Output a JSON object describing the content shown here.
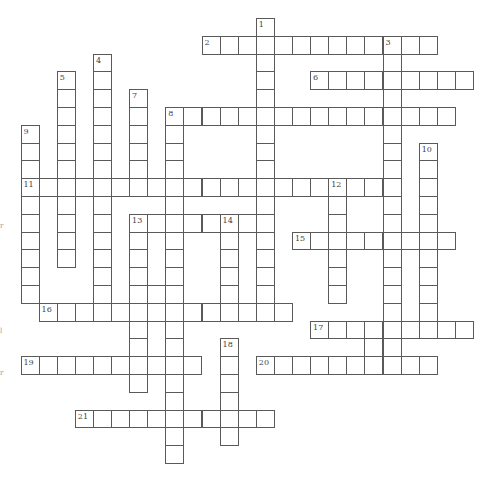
{
  "puzzle": {
    "type": "crossword",
    "grid_unit": "cell",
    "words": [
      {
        "number": 1,
        "direction": "down",
        "row": 0,
        "col": 13,
        "length": 17
      },
      {
        "number": 2,
        "direction": "across",
        "row": 1,
        "col": 10,
        "length": 13
      },
      {
        "number": 3,
        "direction": "down",
        "row": 1,
        "col": 20,
        "length": 19
      },
      {
        "number": 4,
        "direction": "down",
        "row": 2,
        "col": 4,
        "length": 15
      },
      {
        "number": 5,
        "direction": "down",
        "row": 3,
        "col": 2,
        "length": 11
      },
      {
        "number": 6,
        "direction": "across",
        "row": 3,
        "col": 16,
        "length": 9
      },
      {
        "number": 7,
        "direction": "down",
        "row": 4,
        "col": 6,
        "length": 6
      },
      {
        "number": 8,
        "direction": "across",
        "row": 5,
        "col": 8,
        "length": 16
      },
      {
        "number": 8,
        "direction": "down",
        "row": 5,
        "col": 8,
        "length": 20
      },
      {
        "number": 9,
        "direction": "down",
        "row": 6,
        "col": 0,
        "length": 10
      },
      {
        "number": 10,
        "direction": "down",
        "row": 7,
        "col": 22,
        "length": 11
      },
      {
        "number": 11,
        "direction": "across",
        "row": 9,
        "col": 0,
        "length": 21
      },
      {
        "number": 12,
        "direction": "down",
        "row": 9,
        "col": 17,
        "length": 7
      },
      {
        "number": 13,
        "direction": "across",
        "row": 11,
        "col": 6,
        "length": 8
      },
      {
        "number": 13,
        "direction": "down",
        "row": 11,
        "col": 6,
        "length": 10
      },
      {
        "number": 14,
        "direction": "down",
        "row": 11,
        "col": 11,
        "length": 6
      },
      {
        "number": 15,
        "direction": "across",
        "row": 12,
        "col": 15,
        "length": 9
      },
      {
        "number": 16,
        "direction": "across",
        "row": 16,
        "col": 1,
        "length": 14
      },
      {
        "number": 17,
        "direction": "across",
        "row": 17,
        "col": 16,
        "length": 9
      },
      {
        "number": 18,
        "direction": "down",
        "row": 18,
        "col": 11,
        "length": 6
      },
      {
        "number": 19,
        "direction": "across",
        "row": 19,
        "col": 0,
        "length": 10
      },
      {
        "number": 20,
        "direction": "across",
        "row": 19,
        "col": 13,
        "length": 10
      },
      {
        "number": 21,
        "direction": "across",
        "row": 22,
        "col": 3,
        "length": 11
      }
    ],
    "extra_cells": [
      {
        "row": 15,
        "col": 7
      },
      {
        "row": 18,
        "col": 19
      }
    ],
    "numbers": [
      {
        "label": "1",
        "row": 0,
        "col": 13
      },
      {
        "label": "2",
        "row": 1,
        "col": 10
      },
      {
        "label": "3",
        "row": 1,
        "col": 20
      },
      {
        "label": "4",
        "row": 2,
        "col": 4
      },
      {
        "label": "5",
        "row": 3,
        "col": 2
      },
      {
        "label": "6",
        "row": 3,
        "col": 16
      },
      {
        "label": "7",
        "row": 4,
        "col": 6
      },
      {
        "label": "8",
        "row": 5,
        "col": 8
      },
      {
        "label": "9",
        "row": 6,
        "col": 0
      },
      {
        "label": "10",
        "row": 7,
        "col": 22
      },
      {
        "label": "11",
        "row": 9,
        "col": 0
      },
      {
        "label": "12",
        "row": 9,
        "col": 17
      },
      {
        "label": "13",
        "row": 11,
        "col": 6
      },
      {
        "label": "14",
        "row": 11,
        "col": 11
      },
      {
        "label": "15",
        "row": 12,
        "col": 15
      },
      {
        "label": "16",
        "row": 16,
        "col": 1
      },
      {
        "label": "17",
        "row": 17,
        "col": 16
      },
      {
        "label": "18",
        "row": 18,
        "col": 11
      },
      {
        "label": "19",
        "row": 19,
        "col": 0
      },
      {
        "label": "20",
        "row": 19,
        "col": 13
      },
      {
        "label": "21",
        "row": 22,
        "col": 3
      }
    ]
  },
  "edge_marks": [
    {
      "text": "r"
    },
    {
      "text": "l"
    },
    {
      "text": "r"
    }
  ],
  "colors": {
    "grid_line": "#5a5a5a",
    "number_text": "#444444",
    "background": "#ffffff"
  }
}
